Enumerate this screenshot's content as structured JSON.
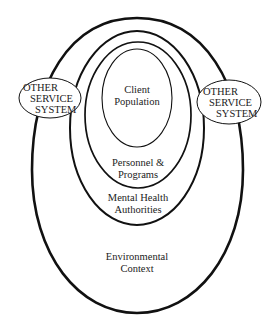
{
  "diagram": {
    "type": "nested-ellipses",
    "colors": {
      "stroke": "#111111",
      "background": "#ffffff",
      "text": "#222222"
    },
    "layers": [
      {
        "id": "environmental-context",
        "lines": [
          "Environmental",
          "Context"
        ]
      },
      {
        "id": "mental-health-authorities",
        "lines": [
          "Mental Health",
          "Authorities"
        ]
      },
      {
        "id": "personnel-programs",
        "lines": [
          "Personnel &",
          "Programs"
        ]
      },
      {
        "id": "client-population",
        "lines": [
          "Client",
          "Population"
        ]
      }
    ],
    "side_nodes": [
      {
        "id": "other-service-system-left",
        "lines": [
          "OTHER",
          "SERVICE",
          "SYSTEM"
        ]
      },
      {
        "id": "other-service-system-right",
        "lines": [
          "OTHER",
          "SERVICE",
          "SYSTEM"
        ]
      }
    ]
  }
}
